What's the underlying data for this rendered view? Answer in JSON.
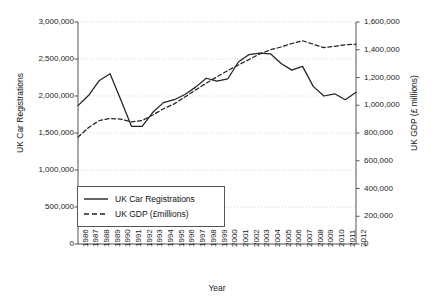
{
  "chart_data": {
    "type": "line",
    "title": "",
    "xlabel": "Year",
    "ylabel": "UK Car Registrations",
    "y2label": "UK GDP (£ millions)",
    "grid": "horizontal-dotted",
    "legend_position": "inside-lower-left",
    "x": [
      1986,
      1987,
      1988,
      1989,
      1990,
      1991,
      1992,
      1993,
      1994,
      1995,
      1996,
      1997,
      1998,
      1999,
      2000,
      2001,
      2002,
      2003,
      2004,
      2005,
      2006,
      2007,
      2008,
      2009,
      2010,
      2011,
      2012
    ],
    "categories": [
      "1986",
      "1987",
      "1988",
      "1989",
      "1990",
      "1991",
      "1992",
      "1993",
      "1994",
      "1995",
      "1996",
      "1997",
      "1998",
      "1999",
      "2000",
      "2001",
      "2002",
      "2003",
      "2004",
      "2005",
      "2006",
      "2007",
      "2008",
      "2009",
      "2010",
      "2011",
      "2012"
    ],
    "ylim": [
      0,
      3000000
    ],
    "y2lim": [
      0,
      1600000
    ],
    "yticks": [
      0,
      500000,
      1000000,
      1500000,
      2000000,
      2500000,
      3000000
    ],
    "yticklabels": [
      "0",
      "500,000",
      "1,000,000",
      "1,500,000",
      "2,000,000",
      "2,500,000",
      "3,000,000"
    ],
    "y2ticks": [
      0,
      200000,
      400000,
      600000,
      800000,
      1000000,
      1200000,
      1400000,
      1600000
    ],
    "y2ticklabels": [
      "0",
      "200,000",
      "400,000",
      "600,000",
      "800,000",
      "1,000,000",
      "1,200,000",
      "1,400,000",
      "1,600,000"
    ],
    "series": [
      {
        "name": "UK Car Registrations",
        "axis": "left",
        "style": "solid",
        "color": "#222222",
        "values": [
          1870000,
          2010000,
          2210000,
          2300000,
          1950000,
          1590000,
          1590000,
          1780000,
          1910000,
          1950000,
          2020000,
          2120000,
          2240000,
          2200000,
          2230000,
          2460000,
          2560000,
          2580000,
          2570000,
          2440000,
          2350000,
          2400000,
          2130000,
          2000000,
          2030000,
          1950000,
          2050000
        ]
      },
      {
        "name": "UK GDP (£millions)",
        "axis": "right",
        "style": "dashed",
        "color": "#222222",
        "values": [
          770000,
          840000,
          890000,
          905000,
          900000,
          880000,
          890000,
          930000,
          975000,
          1010000,
          1060000,
          1110000,
          1160000,
          1205000,
          1250000,
          1290000,
          1330000,
          1370000,
          1400000,
          1420000,
          1445000,
          1465000,
          1440000,
          1415000,
          1425000,
          1435000,
          1440000
        ]
      }
    ]
  },
  "axes": {
    "y_left_title": "UK Car Registrations",
    "y_right_title": "UK GDP (£ millions)",
    "x_title": "Year"
  },
  "legend": {
    "items": [
      {
        "label": "UK Car Registrations",
        "style": "solid"
      },
      {
        "label": "UK GDP (£millions)",
        "style": "dashed"
      }
    ]
  }
}
